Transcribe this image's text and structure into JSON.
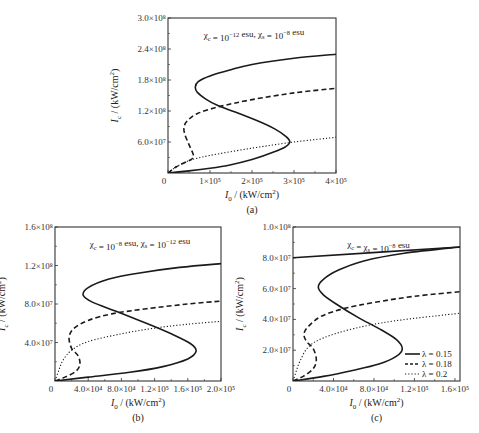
{
  "chart_data": [
    {
      "id": "a",
      "type": "line",
      "caption": "(a)",
      "annotation": "χc = 10^-12 esu, χs = 10^-8 esu",
      "annotation_parts": {
        "a": "χ",
        "a_sub": "c",
        "b": " = 10",
        "b_sup": "−12",
        "c": " esu, χ",
        "c_sub": "s",
        "d": " = 10",
        "d_sup": "−8",
        "e": " esu"
      },
      "xlabel": "I0 / (kW/cm²)",
      "ylabel": "Ic / (kW/cm²)",
      "xlim": [
        0,
        400000
      ],
      "ylim": [
        0,
        300000000
      ],
      "x_ticks": [
        {
          "v": 0,
          "label": "0"
        },
        {
          "v": 100000,
          "label": "1×10⁵"
        },
        {
          "v": 200000,
          "label": "2×10⁵"
        },
        {
          "v": 300000,
          "label": "3×10⁵"
        },
        {
          "v": 400000,
          "label": "4×10⁵"
        }
      ],
      "y_ticks": [
        {
          "v": 60000000,
          "label": "6.0×10⁷"
        },
        {
          "v": 120000000,
          "label": "1.2×10⁸"
        },
        {
          "v": 180000000,
          "label": "1.8×10⁸"
        },
        {
          "v": 240000000,
          "label": "2.4×10⁸"
        },
        {
          "v": 300000000,
          "label": "3.0×10⁸"
        }
      ],
      "grid": false,
      "frame": {
        "left": 168,
        "top": 18,
        "right": 336,
        "bottom": 173
      },
      "series": [
        {
          "name": "λ = 0.15",
          "style": "solid",
          "points": [
            [
              0,
              0
            ],
            [
              50000,
              4000000.0
            ],
            [
              100000,
              9000000.0
            ],
            [
              150000,
              16000000.0
            ],
            [
              200000,
              26000000.0
            ],
            [
              250000,
              40000000.0
            ],
            [
              280000,
              51000000.0
            ],
            [
              290000,
              60000000.0
            ],
            [
              282000,
              70000000.0
            ],
            [
              255000,
              85000000.0
            ],
            [
              210000,
              102000000.0
            ],
            [
              160000,
              118000000.0
            ],
            [
              120000,
              130000000.0
            ],
            [
              90000,
              143000000.0
            ],
            [
              70000,
              156000000.0
            ],
            [
              65000,
              166000000.0
            ],
            [
              72000,
              177000000.0
            ],
            [
              100000,
              188000000.0
            ],
            [
              150000,
              200000000.0
            ],
            [
              200000,
              210000000.0
            ],
            [
              300000,
              222000000.0
            ],
            [
              400000,
              230000000.0
            ]
          ]
        },
        {
          "name": "λ = 0.18",
          "style": "dashed",
          "points": [
            [
              0,
              0
            ],
            [
              20000,
              12000000.0
            ],
            [
              45000,
              22000000.0
            ],
            [
              58000,
              28000000.0
            ],
            [
              60000,
              36000000.0
            ],
            [
              50000,
              55000000.0
            ],
            [
              40000,
              75000000.0
            ],
            [
              38000,
              88000000.0
            ],
            [
              45000,
              100000000.0
            ],
            [
              70000,
              115000000.0
            ],
            [
              120000,
              128000000.0
            ],
            [
              200000,
              142000000.0
            ],
            [
              300000,
              155000000.0
            ],
            [
              400000,
              164000000.0
            ]
          ]
        },
        {
          "name": "λ = 0.2",
          "style": "dotted",
          "points": [
            [
              0,
              0
            ],
            [
              20000,
              12000000.0
            ],
            [
              50000,
              24000000.0
            ],
            [
              100000,
              34000000.0
            ],
            [
              200000,
              48000000.0
            ],
            [
              300000,
              60000000.0
            ],
            [
              400000,
              69000000.0
            ]
          ]
        }
      ]
    },
    {
      "id": "b",
      "type": "line",
      "caption": "(b)",
      "annotation_parts": {
        "a": "χ",
        "a_sub": "c",
        "b": " = 10",
        "b_sup": "−8",
        "c": " esu, χ",
        "c_sub": "s",
        "d": " = 10",
        "d_sup": "−12",
        "e": " esu"
      },
      "xlabel": "I0 / (kW/cm²)",
      "ylabel": "Ic / (kW/cm²)",
      "xlim": [
        0,
        200000
      ],
      "ylim": [
        0,
        160000000
      ],
      "x_ticks": [
        {
          "v": 0,
          "label": "0"
        },
        {
          "v": 40000,
          "label": "4.0×10⁴"
        },
        {
          "v": 80000,
          "label": "8.0×10⁴"
        },
        {
          "v": 120000,
          "label": "1.2×10⁵"
        },
        {
          "v": 160000,
          "label": "1.6×10⁵"
        },
        {
          "v": 200000,
          "label": "2.0×10⁵"
        }
      ],
      "y_ticks": [
        {
          "v": 40000000,
          "label": "4.0×10⁷"
        },
        {
          "v": 80000000,
          "label": "8.0×10⁷"
        },
        {
          "v": 120000000,
          "label": "1.2×10⁸"
        },
        {
          "v": 160000000,
          "label": "1.6×10⁸"
        }
      ],
      "grid": false,
      "frame": {
        "left": 55,
        "top": 227,
        "right": 221,
        "bottom": 381
      },
      "series": [
        {
          "name": "λ = 0.15",
          "style": "solid",
          "points": [
            [
              0,
              0
            ],
            [
              40000,
              4000000.0
            ],
            [
              90000,
              9000000.0
            ],
            [
              130000,
              15000000.0
            ],
            [
              160000,
              23000000.0
            ],
            [
              170000,
              31000000.0
            ],
            [
              163000,
              39000000.0
            ],
            [
              140000,
              49000000.0
            ],
            [
              110000,
              60000000.0
            ],
            [
              75000,
              72000000.0
            ],
            [
              45000,
              82000000.0
            ],
            [
              34000,
              89000000.0
            ],
            [
              40000,
              97000000.0
            ],
            [
              65000,
              106000000.0
            ],
            [
              100000,
              112000000.0
            ],
            [
              150000,
              118000000.0
            ],
            [
              200000,
              122000000.0
            ]
          ]
        },
        {
          "name": "λ = 0.18",
          "style": "dashed",
          "points": [
            [
              0,
              0
            ],
            [
              12000,
              4000000.0
            ],
            [
              25000,
              10000000.0
            ],
            [
              30000,
              17000000.0
            ],
            [
              28000,
              26000000.0
            ],
            [
              20000,
              34000000.0
            ],
            [
              17000,
              45000000.0
            ],
            [
              22000,
              54000000.0
            ],
            [
              40000,
              63000000.0
            ],
            [
              70000,
              70000000.0
            ],
            [
              110000,
              75000000.0
            ],
            [
              160000,
              80000000.0
            ],
            [
              200000,
              83000000.0
            ]
          ]
        },
        {
          "name": "λ = 0.2",
          "style": "dotted",
          "points": [
            [
              0,
              0
            ],
            [
              5000,
              12000000.0
            ],
            [
              10000,
              22000000.0
            ],
            [
              20000,
              32000000.0
            ],
            [
              40000,
              41000000.0
            ],
            [
              80000,
              49000000.0
            ],
            [
              120000,
              55000000.0
            ],
            [
              160000,
              59000000.0
            ],
            [
              200000,
              62000000.0
            ]
          ]
        }
      ]
    },
    {
      "id": "c",
      "type": "line",
      "caption": "(c)",
      "annotation_parts": {
        "a": "χ",
        "a_sub": "c",
        "b": " = χ",
        "b_sub": "s",
        "c": " = 10",
        "c_sup": "−8",
        "d": " esu"
      },
      "xlabel": "I0 / (kW/cm²)",
      "ylabel": "Ic / (kW/cm²)",
      "xlim": [
        0,
        165000
      ],
      "ylim": [
        0,
        100000000
      ],
      "x_ticks": [
        {
          "v": 0,
          "label": "0"
        },
        {
          "v": 40000,
          "label": "4.0×10⁴"
        },
        {
          "v": 80000,
          "label": "8.0×10⁴"
        },
        {
          "v": 120000,
          "label": "1.2×10⁵"
        },
        {
          "v": 160000,
          "label": "1.6×10⁵"
        }
      ],
      "y_ticks": [
        {
          "v": 20000000,
          "label": "2.0×10⁷"
        },
        {
          "v": 40000000,
          "label": "4.0×10⁷"
        },
        {
          "v": 60000000,
          "label": "6.0×10⁷"
        },
        {
          "v": 80000000,
          "label": "8.0×10⁷"
        },
        {
          "v": 100000000,
          "label": "1.0×10⁸"
        }
      ],
      "grid": false,
      "frame": {
        "left": 293,
        "top": 227,
        "right": 460,
        "bottom": 381
      },
      "legend": {
        "position": "lower right",
        "entries": [
          {
            "label": "λ = 0.15",
            "style": "solid"
          },
          {
            "label": "λ = 0.18",
            "style": "dashed"
          },
          {
            "label": "λ = 0.2",
            "style": "dotted"
          }
        ]
      },
      "series": [
        {
          "name": "λ = 0.15",
          "style": "solid",
          "points": [
            [
              0,
              0
            ],
            [
              30000,
              3000000.0
            ],
            [
              60000,
              7000000.0
            ],
            [
              85000,
              11000000.0
            ],
            [
              102000,
              16000000.0
            ],
            [
              108000,
              21000000.0
            ],
            [
              102000,
              27000000.0
            ],
            [
              85000,
              34000000.0
            ],
            [
              65000,
              41000000.0
            ],
            [
              45000,
              49000000.0
            ],
            [
              30000,
              56000000.0
            ],
            [
              25000,
              61000000.0
            ],
            [
              30000,
              66000000.0
            ],
            [
              45000,
              72000000.0
            ],
            [
              70000,
              78000000.0
            ],
            [
              110000,
              83000000.0
            ],
            [
              165000,
              87000000.0
            ]
          ]
        },
        {
          "name": "λ = 0.15 (upper line)",
          "style": "solid",
          "points": [
            [
              0,
              80000000.0
            ],
            [
              165000,
              87000000.0
            ]
          ]
        },
        {
          "name": "λ = 0.18",
          "style": "dashed",
          "points": [
            [
              0,
              0
            ],
            [
              10000,
              3000000.0
            ],
            [
              20000,
              8000000.0
            ],
            [
              23000,
              14000000.0
            ],
            [
              20000,
              21000000.0
            ],
            [
              13000,
              26000000.0
            ],
            [
              11000,
              31000000.0
            ],
            [
              16000,
              36000000.0
            ],
            [
              28000,
              42000000.0
            ],
            [
              50000,
              47000000.0
            ],
            [
              80000,
              51000000.0
            ],
            [
              120000,
              55000000.0
            ],
            [
              165000,
              58000000.0
            ]
          ]
        },
        {
          "name": "λ = 0.2",
          "style": "dotted",
          "points": [
            [
              0,
              0
            ],
            [
              3000,
              6000000.0
            ],
            [
              7000,
              13000000.0
            ],
            [
              15000,
              22000000.0
            ],
            [
              30000,
              28000000.0
            ],
            [
              60000,
              34000000.0
            ],
            [
              100000,
              39000000.0
            ],
            [
              165000,
              44000000.0
            ]
          ]
        }
      ]
    }
  ]
}
